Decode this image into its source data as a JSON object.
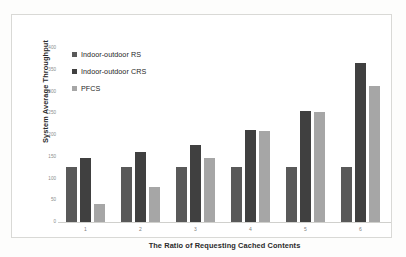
{
  "chart_data": {
    "type": "bar",
    "title": "",
    "xlabel": "The Ratio of Requesting Cached Contents",
    "ylabel": "System Average Throughput",
    "categories": [
      "1",
      "2",
      "3",
      "4",
      "5",
      "6"
    ],
    "ylim": [
      0,
      400
    ],
    "yticks": [
      "0",
      "50",
      "100",
      "150",
      "200",
      "250",
      "300",
      "350",
      "400"
    ],
    "grid": false,
    "legend_position": "top-left",
    "series": [
      {
        "name": "Indoor-outdoor RS",
        "color": "#595959",
        "values": [
          127,
          127,
          127,
          127,
          127,
          126
        ]
      },
      {
        "name": "Indoor-outdoor CRS",
        "color": "#404040",
        "values": [
          148,
          161,
          178,
          212,
          256,
          366
        ]
      },
      {
        "name": "PFCS",
        "color": "#a6a6a6",
        "values": [
          41,
          80,
          148,
          210,
          252,
          313
        ]
      }
    ]
  },
  "colors": {
    "frame_border": "#d9d9d6",
    "plot_background": "#ffffff",
    "axis_line": "#d0d0cd",
    "tick_label": "#808080",
    "axis_title": "#2b2b2b"
  }
}
